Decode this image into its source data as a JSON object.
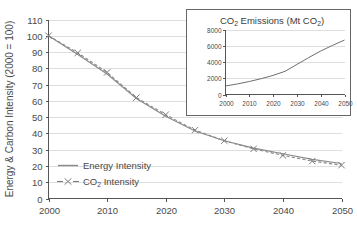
{
  "chart_data": [
    {
      "id": "main",
      "type": "line",
      "title": "",
      "xlabel": "",
      "ylabel": "Energy & Carbon Intensity (2000 = 100)",
      "xlim": [
        2000,
        2050
      ],
      "ylim": [
        0,
        110
      ],
      "xticks": [
        2000,
        2010,
        2020,
        2030,
        2040,
        2050
      ],
      "xtick_labels": [
        "2000",
        "2010",
        "2020",
        "2030",
        "2040",
        "2050"
      ],
      "yticks": [
        0,
        10,
        20,
        30,
        40,
        50,
        60,
        70,
        80,
        90,
        100,
        110
      ],
      "ytick_labels": [
        "0",
        "10",
        "20",
        "30",
        "40",
        "50",
        "60",
        "70",
        "80",
        "90",
        "100",
        "110"
      ],
      "grid": true,
      "grid_axis": "y",
      "legend_position": "lower-left",
      "x": [
        2000,
        2005,
        2010,
        2015,
        2020,
        2025,
        2030,
        2035,
        2040,
        2045,
        2050
      ],
      "series": [
        {
          "name": "Energy Intensity",
          "marker": "none",
          "linestyle": "solid",
          "color": "#8a8a8a",
          "values": [
            100,
            88.5,
            76.5,
            61.5,
            50.5,
            41.5,
            35.5,
            31.0,
            27.5,
            24.0,
            21.5
          ]
        },
        {
          "name": "CO2 Intensity",
          "marker": "x",
          "linestyle": "dashed",
          "color": "#7d7d7d",
          "values": [
            100,
            89.5,
            77.5,
            62.0,
            51.5,
            42.0,
            35.5,
            30.5,
            26.5,
            23.0,
            20.5
          ]
        }
      ]
    },
    {
      "id": "inset",
      "type": "line",
      "title": "CO2 Emissions (Mt CO2)",
      "title_parts": [
        "CO",
        "2",
        " Emissions (Mt CO",
        "2",
        ")"
      ],
      "xlabel": "",
      "ylabel": "",
      "xlim": [
        2000,
        2050
      ],
      "ylim": [
        0,
        8000
      ],
      "xticks": [
        2000,
        2010,
        2020,
        2030,
        2040,
        2050
      ],
      "xtick_labels": [
        "2000",
        "2010",
        "2020",
        "2030",
        "2040",
        "2050"
      ],
      "yticks": [
        0,
        2000,
        4000,
        6000,
        8000
      ],
      "ytick_labels": [
        "0",
        "2000",
        "4000",
        "6000",
        "8000"
      ],
      "grid": true,
      "grid_axis": "y",
      "x": [
        2000,
        2005,
        2010,
        2015,
        2020,
        2025,
        2030,
        2035,
        2040,
        2045,
        2050
      ],
      "series": [
        {
          "name": "CO2 Emissions",
          "marker": "none",
          "linestyle": "solid",
          "color": "#6f6f6f",
          "values": [
            1050,
            1300,
            1600,
            1950,
            2350,
            2850,
            3700,
            4550,
            5350,
            6050,
            6700
          ]
        }
      ]
    }
  ],
  "main": {
    "ylabel": "Energy & Carbon Intensity (2000 = 100)",
    "legend": {
      "energy_label": "Energy Intensity",
      "co2_label_prefix": "CO",
      "co2_label_sub": "2",
      "co2_label_suffix": " Intensity"
    }
  },
  "inset": {
    "title_prefix": "CO",
    "title_sub1": "2",
    "title_mid": " Emissions (Mt CO",
    "title_sub2": "2",
    "title_suffix": ")"
  },
  "colors": {
    "background": "#ffffff",
    "axis": "#555555",
    "grid": "#d6d6d6",
    "energy_series": "#8a8a8a",
    "co2_series": "#7d7d7d",
    "inset_series": "#6f6f6f",
    "text": "#4a4a4a"
  }
}
